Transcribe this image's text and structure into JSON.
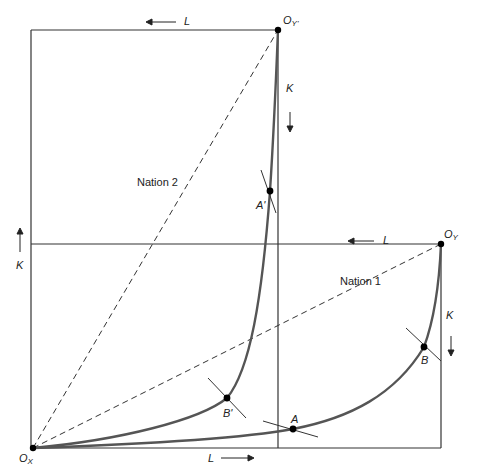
{
  "diagram": {
    "title": "",
    "type": "Edgeworth box — two nations (factor endowment / trade)",
    "colors": {
      "box_line": "#333333",
      "curve": "#555555",
      "dashed": "#333333",
      "point": "#000000",
      "text": "#222222"
    },
    "regions": {
      "nation2": "Nation 2",
      "nation1": "Nation 1"
    },
    "origins": {
      "ox": {
        "main": "O",
        "sub": "X"
      },
      "oy": {
        "main": "O",
        "sub": "Y"
      },
      "oy_prime": {
        "main": "O",
        "sub": "Y'"
      }
    },
    "points": {
      "A": "A",
      "A_prime": "A'",
      "B": "B",
      "B_prime": "B'"
    },
    "axis_labels": {
      "top_L": "L",
      "top_K": "K",
      "mid_L": "L",
      "left_K": "K",
      "right_K": "K",
      "bottom_L": "L"
    }
  }
}
